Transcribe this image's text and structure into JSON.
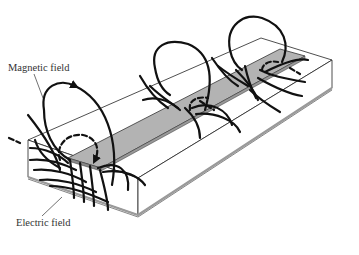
{
  "figure": {
    "labels": {
      "magnetic": "Magnetic field",
      "electric": "Electric field"
    },
    "colors": {
      "strip": "#b3b3b3",
      "substrate": "#ffffff",
      "lines": "#111111",
      "ground_plane": "#9a9a9a"
    }
  }
}
